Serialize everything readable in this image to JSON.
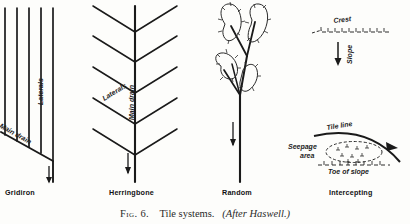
{
  "figure": {
    "caption_number": "Fig. 6.",
    "caption_text": "Tile systems.",
    "caption_source": "(After Haswell.)"
  },
  "panels": [
    {
      "id": "gridiron",
      "title": "Gridiron",
      "labels": {
        "laterals": "Laterals",
        "main_drain": "Main drain"
      },
      "lateral_count": 5,
      "flow_arrow": "down-arrow-icon"
    },
    {
      "id": "herringbone",
      "title": "Herringbone",
      "labels": {
        "laterals": "Laterals",
        "main_drain": "Main drain"
      },
      "lateral_count": 10,
      "flow_arrow": "down-arrow-icon"
    },
    {
      "id": "random",
      "title": "Random",
      "labels": {},
      "depression_count": 4,
      "flow_arrow": "down-arrow-icon"
    },
    {
      "id": "intercepting",
      "title": "Intercepting",
      "labels": {
        "crest": "Crest",
        "slope": "Slope",
        "tile_line": "Tile line",
        "seepage_area_line1": "Seepage",
        "seepage_area_line2": "area",
        "toe_of_slope": "Toe of slope"
      },
      "flow_arrow": "down-arrow-icon"
    }
  ],
  "colors": {
    "ink": "#1a1a1a",
    "paper": "#fdfdfb"
  }
}
